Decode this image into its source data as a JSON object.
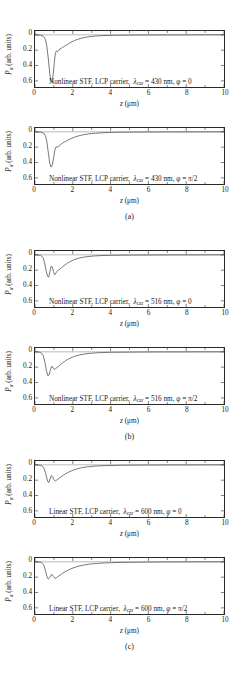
{
  "figure": {
    "axis_titles": {
      "x": "z (μm)",
      "y_symbol": "P",
      "y_subscript": "α",
      "y_rest": " (arb. units)"
    },
    "xticks": [
      "0",
      "2",
      "4",
      "6",
      "8",
      "10"
    ],
    "yticks": [
      "0",
      "0.2",
      "0.4",
      "0.6"
    ]
  },
  "groups": [
    {
      "caption": "(a)",
      "panels": [
        {
          "annotation": "Nonlinear STF, LCP carrier,  λ_car = 430 nm, φ = 0",
          "medium": "Nonlinear STF",
          "carrier": "LCP carrier",
          "lambda_symbol": "λ",
          "lambda_sub": "car",
          "lambda_value": "430 nm",
          "phi_symbol": "φ",
          "phi_value": "0"
        },
        {
          "annotation": "Nonlinear STF, LCP carrier,  λ_car = 430 nm, φ = π/2",
          "medium": "Nonlinear STF",
          "carrier": "LCP carrier",
          "lambda_symbol": "λ",
          "lambda_sub": "car",
          "lambda_value": "430 nm",
          "phi_symbol": "φ",
          "phi_value": "π/2"
        }
      ]
    },
    {
      "caption": "(b)",
      "panels": [
        {
          "annotation": "Nonlinear STF, LCP carrier,  λ_car = 516 nm, φ = 0",
          "medium": "Nonlinear STF",
          "carrier": "LCP carrier",
          "lambda_symbol": "λ",
          "lambda_sub": "car",
          "lambda_value": "516 nm",
          "phi_symbol": "φ",
          "phi_value": "0"
        },
        {
          "annotation": "Nonlinear STF, LCP carrier,  λ_car = 516 nm, φ = π/2",
          "medium": "Nonlinear STF",
          "carrier": "LCP carrier",
          "lambda_symbol": "λ",
          "lambda_sub": "car",
          "lambda_value": "516 nm",
          "phi_symbol": "φ",
          "phi_value": "π/2"
        }
      ]
    },
    {
      "caption": "(c)",
      "panels": [
        {
          "annotation": "Linear STF, LCP carrier,  λ_car = 600 nm, φ = 0",
          "medium": "Linear STF",
          "carrier": "LCP carrier",
          "lambda_symbol": "λ",
          "lambda_sub": "car",
          "lambda_value": "600 nm",
          "phi_symbol": "φ",
          "phi_value": "0"
        },
        {
          "annotation": "Linear STF, LCP carrier,  λ_car = 600 nm, φ = π/2",
          "medium": "Linear STF",
          "carrier": "LCP carrier",
          "lambda_symbol": "λ",
          "lambda_sub": "car",
          "lambda_value": "600 nm",
          "phi_symbol": "φ",
          "phi_value": "π/2"
        }
      ]
    }
  ],
  "chart_data": [
    {
      "type": "line",
      "title": "Nonlinear STF, LCP carrier, lambda_car = 430 nm, phi = 0",
      "xlabel": "z (μm)",
      "ylabel": "P_alpha (arb. units)",
      "xlim": [
        0,
        10
      ],
      "ylim": [
        -0.68,
        0.05
      ],
      "y_axis_inverted_labels": true,
      "grid": false,
      "legend": "none",
      "x": [
        0.0,
        0.3,
        0.45,
        0.55,
        0.62,
        0.7,
        0.78,
        0.84,
        0.9,
        0.97,
        1.03,
        1.08,
        1.13,
        1.18,
        1.24,
        1.3,
        1.38,
        1.46,
        1.55,
        1.65,
        1.78,
        1.92,
        2.08,
        2.25,
        2.45,
        2.65,
        2.9,
        3.2,
        3.6,
        4.2,
        5.0,
        6.0,
        7.0,
        8.0,
        9.0,
        10.0
      ],
      "y": [
        0.0,
        -0.005,
        -0.02,
        -0.06,
        -0.14,
        -0.3,
        -0.5,
        -0.61,
        -0.62,
        -0.5,
        -0.34,
        -0.24,
        -0.21,
        -0.22,
        -0.21,
        -0.185,
        -0.175,
        -0.165,
        -0.15,
        -0.135,
        -0.115,
        -0.095,
        -0.075,
        -0.058,
        -0.044,
        -0.033,
        -0.024,
        -0.016,
        -0.01,
        -0.006,
        -0.003,
        -0.002,
        -0.001,
        -0.001,
        0.0,
        0.0
      ]
    },
    {
      "type": "line",
      "title": "Nonlinear STF, LCP carrier, lambda_car = 430 nm, phi = pi/2",
      "xlabel": "z (μm)",
      "ylabel": "P_alpha (arb. units)",
      "xlim": [
        0,
        10
      ],
      "ylim": [
        -0.68,
        0.05
      ],
      "y_axis_inverted_labels": true,
      "grid": false,
      "legend": "none",
      "x": [
        0.0,
        0.3,
        0.45,
        0.55,
        0.62,
        0.7,
        0.78,
        0.85,
        0.92,
        0.99,
        1.05,
        1.1,
        1.16,
        1.22,
        1.28,
        1.35,
        1.44,
        1.54,
        1.66,
        1.8,
        1.96,
        2.14,
        2.34,
        2.58,
        2.86,
        3.2,
        3.65,
        4.3,
        5.2,
        6.2,
        7.2,
        8.2,
        9.2,
        10.0
      ],
      "y": [
        0.0,
        -0.004,
        -0.015,
        -0.05,
        -0.12,
        -0.26,
        -0.41,
        -0.46,
        -0.43,
        -0.33,
        -0.24,
        -0.2,
        -0.195,
        -0.2,
        -0.185,
        -0.165,
        -0.15,
        -0.135,
        -0.118,
        -0.1,
        -0.082,
        -0.065,
        -0.05,
        -0.037,
        -0.026,
        -0.018,
        -0.011,
        -0.006,
        -0.003,
        -0.002,
        -0.001,
        -0.001,
        0.0,
        0.0
      ]
    },
    {
      "type": "line",
      "title": "Nonlinear STF, LCP carrier, lambda_car = 516 nm, phi = 0",
      "xlabel": "z (μm)",
      "ylabel": "P_alpha (arb. units)",
      "xlim": [
        0,
        10
      ],
      "ylim": [
        -0.68,
        0.05
      ],
      "y_axis_inverted_labels": true,
      "grid": false,
      "legend": "none",
      "x": [
        0.0,
        0.3,
        0.44,
        0.52,
        0.6,
        0.67,
        0.73,
        0.79,
        0.85,
        0.92,
        0.98,
        1.04,
        1.1,
        1.16,
        1.23,
        1.32,
        1.42,
        1.54,
        1.68,
        1.84,
        2.02,
        2.22,
        2.46,
        2.74,
        3.1,
        3.6,
        4.3,
        5.2,
        6.2,
        7.2,
        8.2,
        9.2,
        10.0
      ],
      "y": [
        0.0,
        -0.006,
        -0.04,
        -0.12,
        -0.22,
        -0.28,
        -0.29,
        -0.22,
        -0.15,
        -0.16,
        -0.22,
        -0.26,
        -0.24,
        -0.215,
        -0.2,
        -0.185,
        -0.165,
        -0.14,
        -0.115,
        -0.09,
        -0.068,
        -0.05,
        -0.035,
        -0.024,
        -0.015,
        -0.009,
        -0.005,
        -0.003,
        -0.002,
        -0.001,
        -0.001,
        0.0,
        0.0
      ]
    },
    {
      "type": "line",
      "title": "Nonlinear STF, LCP carrier, lambda_car = 516 nm, phi = pi/2",
      "xlabel": "z (μm)",
      "ylabel": "P_alpha (arb. units)",
      "xlim": [
        0,
        10
      ],
      "ylim": [
        -0.68,
        0.05
      ],
      "y_axis_inverted_labels": true,
      "grid": false,
      "legend": "none",
      "x": [
        0.0,
        0.3,
        0.44,
        0.53,
        0.61,
        0.68,
        0.75,
        0.81,
        0.88,
        0.95,
        1.02,
        1.09,
        1.16,
        1.24,
        1.33,
        1.44,
        1.57,
        1.72,
        1.9,
        2.1,
        2.34,
        2.62,
        2.96,
        3.4,
        4.0,
        4.8,
        5.8,
        6.8,
        7.8,
        8.8,
        10.0
      ],
      "y": [
        0.0,
        -0.006,
        -0.05,
        -0.14,
        -0.25,
        -0.31,
        -0.3,
        -0.24,
        -0.19,
        -0.2,
        -0.23,
        -0.22,
        -0.205,
        -0.19,
        -0.17,
        -0.148,
        -0.124,
        -0.1,
        -0.078,
        -0.058,
        -0.041,
        -0.028,
        -0.018,
        -0.011,
        -0.006,
        -0.004,
        -0.002,
        -0.001,
        -0.001,
        0.0,
        0.0
      ]
    },
    {
      "type": "line",
      "title": "Linear STF, LCP carrier, lambda_car = 600 nm, phi = 0",
      "xlabel": "z (μm)",
      "ylabel": "P_alpha (arb. units)",
      "xlim": [
        0,
        10
      ],
      "ylim": [
        -0.68,
        0.05
      ],
      "y_axis_inverted_labels": true,
      "grid": false,
      "legend": "none",
      "x": [
        0.0,
        0.32,
        0.46,
        0.55,
        0.62,
        0.68,
        0.74,
        0.8,
        0.86,
        0.93,
        1.0,
        1.07,
        1.14,
        1.22,
        1.32,
        1.44,
        1.58,
        1.74,
        1.94,
        2.16,
        2.42,
        2.74,
        3.14,
        3.66,
        4.4,
        5.4,
        6.4,
        7.4,
        8.4,
        9.4,
        10.0
      ],
      "y": [
        0.0,
        -0.005,
        -0.035,
        -0.1,
        -0.17,
        -0.22,
        -0.23,
        -0.185,
        -0.14,
        -0.155,
        -0.195,
        -0.21,
        -0.2,
        -0.185,
        -0.168,
        -0.145,
        -0.122,
        -0.1,
        -0.077,
        -0.057,
        -0.04,
        -0.027,
        -0.017,
        -0.01,
        -0.006,
        -0.003,
        -0.002,
        -0.001,
        -0.001,
        0.0,
        0.0
      ]
    },
    {
      "type": "line",
      "title": "Linear STF, LCP carrier, lambda_car = 600 nm, phi = pi/2",
      "xlabel": "z (μm)",
      "ylabel": "P_alpha (arb. units)",
      "xlim": [
        0,
        10
      ],
      "ylim": [
        -0.68,
        0.05
      ],
      "y_axis_inverted_labels": true,
      "grid": false,
      "legend": "none",
      "x": [
        0.0,
        0.32,
        0.46,
        0.55,
        0.63,
        0.7,
        0.77,
        0.84,
        0.91,
        0.98,
        1.06,
        1.14,
        1.23,
        1.33,
        1.45,
        1.59,
        1.76,
        1.96,
        2.2,
        2.48,
        2.82,
        3.24,
        3.8,
        4.6,
        5.6,
        6.6,
        7.6,
        8.6,
        10.0
      ],
      "y": [
        0.0,
        -0.005,
        -0.04,
        -0.11,
        -0.19,
        -0.225,
        -0.21,
        -0.175,
        -0.165,
        -0.195,
        -0.215,
        -0.205,
        -0.19,
        -0.172,
        -0.152,
        -0.13,
        -0.107,
        -0.085,
        -0.064,
        -0.046,
        -0.032,
        -0.021,
        -0.013,
        -0.007,
        -0.004,
        -0.002,
        -0.001,
        0.0,
        0.0
      ]
    }
  ]
}
